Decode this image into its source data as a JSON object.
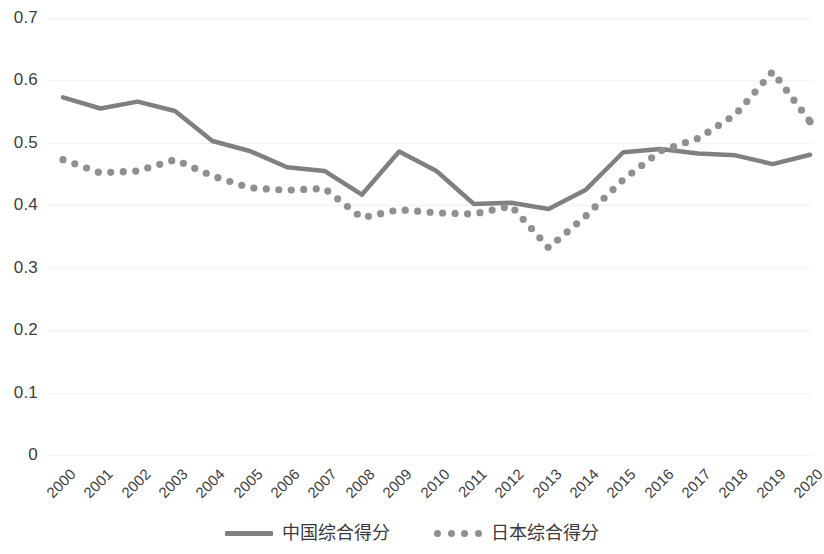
{
  "chart_data": {
    "type": "line",
    "title": "",
    "subtitle": "",
    "xlabel": "",
    "ylabel": "",
    "ylim": [
      0,
      0.7
    ],
    "ytick_step": 0.1,
    "grid": true,
    "legend_position": "bottom",
    "x": [
      "2000",
      "2001",
      "2002",
      "2003",
      "2004",
      "2005",
      "2006",
      "2007",
      "2008",
      "2009",
      "2010",
      "2011",
      "2012",
      "2013",
      "2014",
      "2015",
      "2016",
      "2017",
      "2018",
      "2019",
      "2020"
    ],
    "ytick_labels": [
      "0.7",
      "0.6",
      "0.5",
      "0.4",
      "0.3",
      "0.2",
      "0.1",
      "0"
    ],
    "ytick_values": [
      0.7,
      0.6,
      0.5,
      0.4,
      0.3,
      0.2,
      0.1,
      0
    ],
    "series": [
      {
        "name": "中国综合得分",
        "style": "solid",
        "color": "#808080",
        "values": [
          0.573,
          0.555,
          0.566,
          0.551,
          0.503,
          0.487,
          0.461,
          0.455,
          0.417,
          0.486,
          0.455,
          0.402,
          0.404,
          0.394,
          0.425,
          0.485,
          0.49,
          0.483,
          0.48,
          0.466,
          0.481
        ]
      },
      {
        "name": "日本综合得分",
        "style": "dotted",
        "color": "#909090",
        "values": [
          0.473,
          0.452,
          0.455,
          0.473,
          0.447,
          0.428,
          0.424,
          0.427,
          0.38,
          0.393,
          0.388,
          0.386,
          0.399,
          0.332,
          0.383,
          0.441,
          0.487,
          0.507,
          0.545,
          0.614,
          0.534
        ]
      }
    ]
  },
  "legend": {
    "items": [
      {
        "label": "中国综合得分",
        "style": "solid"
      },
      {
        "label": "日本综合得分",
        "style": "dotted"
      }
    ]
  }
}
